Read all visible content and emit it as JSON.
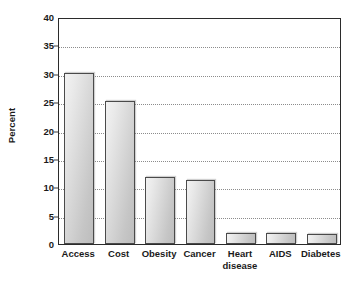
{
  "chart_data": {
    "type": "bar",
    "title": "",
    "subtitle": "",
    "xlabel": "",
    "ylabel": "Percent",
    "categories": [
      "Access",
      "Cost",
      "Obesity",
      "Cancer",
      "Heart\ndisease",
      "AIDS",
      "Diabetes"
    ],
    "values": [
      30.2,
      25.2,
      11.8,
      11.2,
      1.9,
      1.9,
      1.8
    ],
    "ylim": [
      0,
      40
    ],
    "ytick_labels": [
      "0",
      "5",
      "10",
      "15",
      "20",
      "25",
      "30",
      "35",
      "40"
    ],
    "ytick_values": [
      0,
      5,
      10,
      15,
      20,
      25,
      30,
      35,
      40
    ],
    "grid": true,
    "grid_axis": "y",
    "grid_style": "dotted",
    "legend": false,
    "legend_position": "none",
    "bar_fill_light": "#f2f2f2",
    "bar_fill_dark": "#bdbdbd",
    "bar_border_color": "#4a4a4a",
    "grid_color": "#8c8c8c",
    "axis_color": "#2b2b2b",
    "text_color": "#1a1a1a",
    "background": "#ffffff"
  }
}
